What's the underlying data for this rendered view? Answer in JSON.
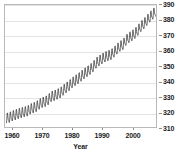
{
  "chart_data": {
    "type": "line",
    "title": "",
    "subtitle": "",
    "xlabel": "Year",
    "ylabel": "",
    "y_axis_position": "right",
    "grid": "horizontal",
    "legend": "none",
    "xlim": [
      1957.5,
      2008.0
    ],
    "ylim": [
      310,
      390
    ],
    "x_ticks": [
      1960,
      1970,
      1980,
      1990,
      2000
    ],
    "y_ticks": [
      310,
      320,
      330,
      340,
      350,
      360,
      370,
      380,
      390
    ],
    "x_tick_labels": [
      "1960",
      "1970",
      "1980",
      "1990",
      "2000"
    ],
    "y_tick_labels": [
      "310",
      "320",
      "330",
      "340",
      "350",
      "360",
      "370",
      "380",
      "390"
    ],
    "series": [
      {
        "name": "Atmospheric CO2 concentration",
        "color": "#2e2e2e",
        "line_width": 0.7,
        "description": "Monthly mean CO2 (ppm) with seasonal sawtooth oscillation superimposed on a rising trend",
        "seasonal_amplitude_ppm": 3.0,
        "annual_means": {
          "x": [
            1958,
            1959,
            1960,
            1961,
            1962,
            1963,
            1964,
            1965,
            1966,
            1967,
            1968,
            1969,
            1970,
            1971,
            1972,
            1973,
            1974,
            1975,
            1976,
            1977,
            1978,
            1979,
            1980,
            1981,
            1982,
            1983,
            1984,
            1985,
            1986,
            1987,
            1988,
            1989,
            1990,
            1991,
            1992,
            1993,
            1994,
            1995,
            1996,
            1997,
            1998,
            1999,
            2000,
            2001,
            2002,
            2003,
            2004,
            2005,
            2006,
            2007
          ],
          "y": [
            315.3,
            315.9,
            316.9,
            317.6,
            318.4,
            318.9,
            319.6,
            320.0,
            321.4,
            322.2,
            323.0,
            324.6,
            325.7,
            326.3,
            327.5,
            329.7,
            330.2,
            331.1,
            332.0,
            333.8,
            335.4,
            336.8,
            338.7,
            340.1,
            341.4,
            343.0,
            344.6,
            346.0,
            347.4,
            349.2,
            351.6,
            353.1,
            354.4,
            355.6,
            356.4,
            357.1,
            358.8,
            360.8,
            362.6,
            363.7,
            366.6,
            368.3,
            369.5,
            371.0,
            373.1,
            375.6,
            377.4,
            379.6,
            381.8,
            383.7
          ]
        }
      }
    ]
  },
  "axes": {
    "x_title": "Year"
  }
}
